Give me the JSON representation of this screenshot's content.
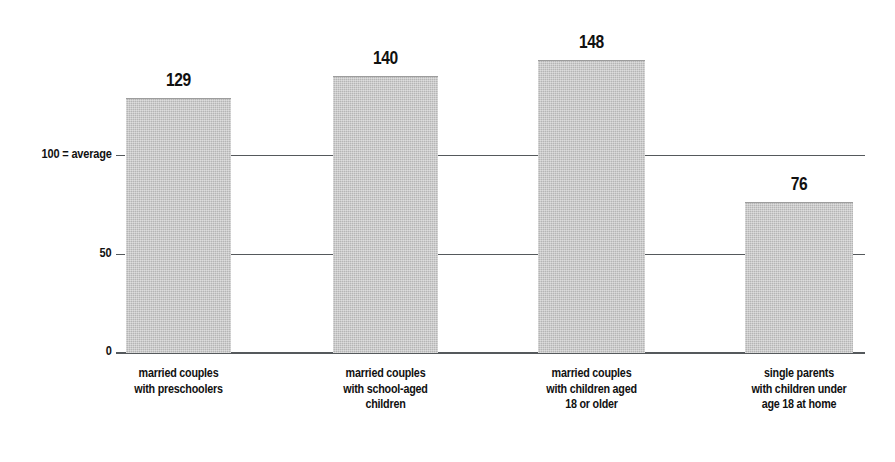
{
  "chart_data": {
    "type": "bar",
    "title": "",
    "subtitle": "",
    "xlabel": "",
    "ylabel": "",
    "categories": [
      "married couples with preschoolers",
      "married couples with school-aged children",
      "married couples with children aged 18 or older",
      "single parents with children under age 18 at home"
    ],
    "category_lines": [
      [
        "married couples",
        "with preschoolers"
      ],
      [
        "married couples",
        "with school-aged",
        "children"
      ],
      [
        "married couples",
        "with children aged",
        "18 or older"
      ],
      [
        "single parents",
        "with children under",
        "age 18 at home"
      ]
    ],
    "values": [
      129,
      140,
      148,
      76
    ],
    "value_labels": [
      "129",
      "140",
      "148",
      "76"
    ],
    "ylim": [
      0,
      160
    ],
    "yticks": [
      0,
      50,
      100
    ],
    "ytick_labels": [
      "0",
      "50",
      "100 = average"
    ],
    "grid": true,
    "gridlines_at": [
      50,
      100
    ],
    "legend": "none",
    "bar_color": "#b5b5b5",
    "axis_color": "#55595c",
    "text_color": "#111111",
    "background": "#ffffff"
  }
}
